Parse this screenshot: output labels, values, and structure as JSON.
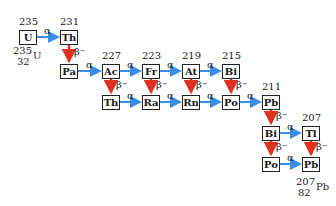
{
  "diagram": {
    "colors": {
      "alpha_arrow": "#3a8ee6",
      "beta_arrow": "#e0301e",
      "box_border": "#222222"
    },
    "nodes": [
      {
        "id": "U",
        "symbol": "U",
        "mass": "235"
      },
      {
        "id": "Th1",
        "symbol": "Th",
        "mass": "231"
      },
      {
        "id": "Pa",
        "symbol": "Pa"
      },
      {
        "id": "Ac",
        "symbol": "Ac",
        "mass": "227"
      },
      {
        "id": "Fr",
        "symbol": "Fr",
        "mass": "223"
      },
      {
        "id": "At",
        "symbol": "At",
        "mass": "219"
      },
      {
        "id": "Bi1",
        "symbol": "Bi",
        "mass": "215"
      },
      {
        "id": "Th2",
        "symbol": "Th"
      },
      {
        "id": "Ra",
        "symbol": "Ra"
      },
      {
        "id": "Rn",
        "symbol": "Rn"
      },
      {
        "id": "Po1",
        "symbol": "Po"
      },
      {
        "id": "Pb1",
        "symbol": "Pb",
        "mass": "211"
      },
      {
        "id": "Bi2",
        "symbol": "Bi"
      },
      {
        "id": "Tl",
        "symbol": "Tl",
        "mass": "207"
      },
      {
        "id": "Po2",
        "symbol": "Po"
      },
      {
        "id": "Pb2",
        "symbol": "Pb"
      }
    ],
    "start_label": {
      "mass": "235",
      "symbol": "U",
      "atomic_number": "32"
    },
    "end_label": {
      "mass": "207",
      "symbol": "Pb",
      "atomic_number": "82"
    },
    "decay_labels": {
      "alpha": "α",
      "beta": "β",
      "beta_sup": "−"
    },
    "transitions": [
      {
        "from": "U",
        "to": "Th1",
        "type": "alpha"
      },
      {
        "from": "Th1",
        "to": "Pa",
        "type": "beta"
      },
      {
        "from": "Pa",
        "to": "Ac",
        "type": "alpha"
      },
      {
        "from": "Ac",
        "to": "Fr",
        "type": "alpha"
      },
      {
        "from": "Ac",
        "to": "Th2",
        "type": "beta"
      },
      {
        "from": "Fr",
        "to": "At",
        "type": "alpha"
      },
      {
        "from": "Fr",
        "to": "Ra",
        "type": "beta"
      },
      {
        "from": "At",
        "to": "Bi1",
        "type": "alpha"
      },
      {
        "from": "At",
        "to": "Rn",
        "type": "beta"
      },
      {
        "from": "Bi1",
        "to": "Po1",
        "type": "beta"
      },
      {
        "from": "Th2",
        "to": "Ra",
        "type": "alpha"
      },
      {
        "from": "Ra",
        "to": "Rn",
        "type": "alpha"
      },
      {
        "from": "Rn",
        "to": "Po1",
        "type": "alpha"
      },
      {
        "from": "Po1",
        "to": "Pb1",
        "type": "alpha"
      },
      {
        "from": "Pb1",
        "to": "Bi2",
        "type": "beta"
      },
      {
        "from": "Bi2",
        "to": "Tl",
        "type": "alpha"
      },
      {
        "from": "Bi2",
        "to": "Po2",
        "type": "beta"
      },
      {
        "from": "Tl",
        "to": "Pb2",
        "type": "beta"
      },
      {
        "from": "Po2",
        "to": "Pb2",
        "type": "alpha"
      }
    ]
  }
}
